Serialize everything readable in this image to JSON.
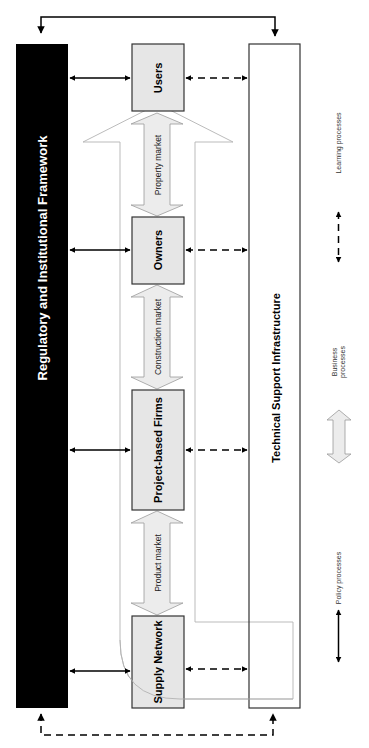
{
  "colors": {
    "framework_fill": "#000000",
    "framework_text": "#ffffff",
    "actor_fill": "#e6e6e6",
    "actor_border": "#333333",
    "market_arrow_fill": "#ececec",
    "market_arrow_stroke": "#9a9a9a",
    "learning_arrow_stroke": "#b3b3b3",
    "line": "#000000",
    "legend_text": "#333333"
  },
  "framework": {
    "label": "Regulatory and Institutional Framework"
  },
  "infrastructure": {
    "label": "Technical Support Infrastructure"
  },
  "actors": [
    {
      "id": "users",
      "label": "Users"
    },
    {
      "id": "owners",
      "label": "Owners"
    },
    {
      "id": "project-based-firms",
      "label": "Project-based Firms"
    },
    {
      "id": "supply-network",
      "label": "Supply Network"
    }
  ],
  "markets": [
    {
      "id": "property",
      "label": "Property market"
    },
    {
      "id": "construction",
      "label": "Construction market"
    },
    {
      "id": "product",
      "label": "Product market"
    }
  ],
  "legend": {
    "learning": "Learning processes",
    "business_line1": "Business",
    "business_line2": "processes",
    "policy": "Policy processes"
  }
}
